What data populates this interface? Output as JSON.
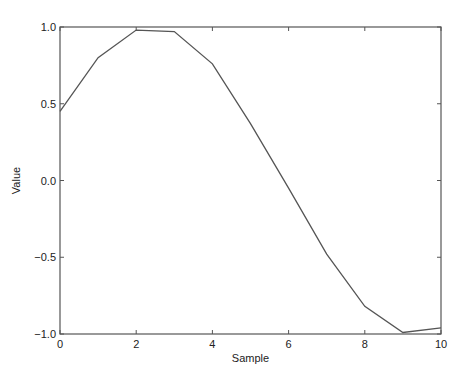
{
  "chart_data": {
    "type": "line",
    "title": "",
    "xlabel": "Sample",
    "ylabel": "Value",
    "x": [
      0,
      1,
      2,
      3,
      4,
      5,
      6,
      7,
      8,
      9,
      10
    ],
    "series": [
      {
        "name": "signal",
        "values": [
          0.45,
          0.8,
          0.98,
          0.97,
          0.76,
          0.37,
          -0.05,
          -0.48,
          -0.82,
          -0.99,
          -0.96
        ]
      }
    ],
    "xlim": [
      0,
      10
    ],
    "ylim": [
      -1.0,
      1.0
    ],
    "xticks": [
      "0",
      "2",
      "4",
      "6",
      "8",
      "10"
    ],
    "yticks": [
      "1.0",
      "0.5",
      "0.0",
      "-0.5",
      "-1.0"
    ],
    "grid": false,
    "line_color": "#555555"
  }
}
